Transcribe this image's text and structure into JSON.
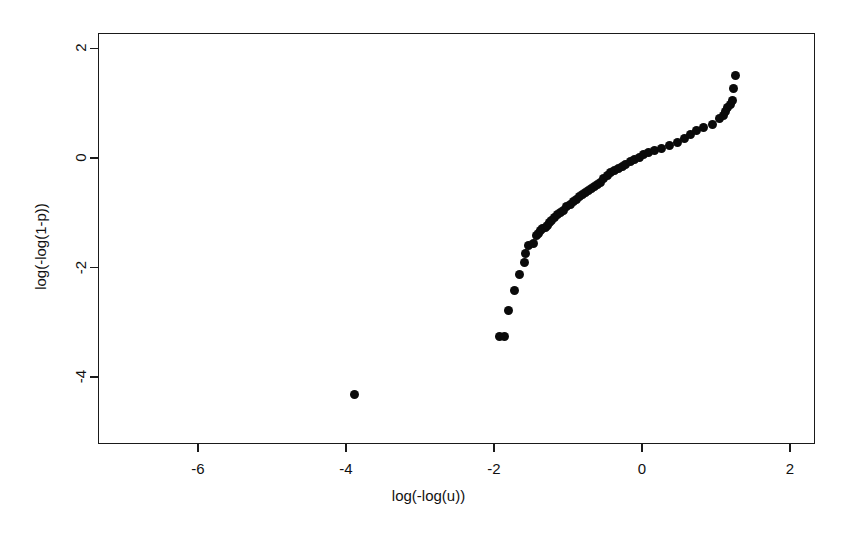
{
  "chart_data": {
    "type": "scatter",
    "title": "",
    "subtitle": "",
    "xlabel": "log(-log(u))",
    "ylabel": "log(-log(1-p))",
    "xlim": [
      -7.35,
      2.34
    ],
    "ylim": [
      -5.22,
      2.28
    ],
    "xticks": [
      -6,
      -4,
      -2,
      0,
      2
    ],
    "xticklabels": [
      "-6",
      "-4",
      "-2",
      "0",
      "2"
    ],
    "yticks": [
      2,
      0,
      -2,
      -4
    ],
    "yticklabels": [
      "2",
      "0",
      "-2",
      "-4"
    ],
    "grid": false,
    "legend": null,
    "legend_position": "none",
    "marker": "filled-circle",
    "marker_color": "#0a0a0a",
    "marker_size_px": 9,
    "series": [
      {
        "name": "quantile-pairs",
        "x": [
          -3.88,
          -1.93,
          -1.86,
          -1.8,
          -1.72,
          -1.66,
          -1.59,
          -1.57,
          -1.53,
          -1.47,
          -1.43,
          -1.4,
          -1.37,
          -1.34,
          -1.31,
          -1.28,
          -1.25,
          -1.22,
          -1.18,
          -1.14,
          -1.1,
          -1.06,
          -1.02,
          -0.97,
          -0.93,
          -0.88,
          -0.84,
          -0.8,
          -0.76,
          -0.72,
          -0.68,
          -0.64,
          -0.6,
          -0.56,
          -0.52,
          -0.47,
          -0.42,
          -0.37,
          -0.32,
          -0.27,
          -0.22,
          -0.16,
          -0.1,
          -0.04,
          0.02,
          0.09,
          0.17,
          0.26,
          0.37,
          0.48,
          0.58,
          0.66,
          0.74,
          0.83,
          0.95,
          1.05,
          1.1,
          1.13,
          1.16,
          1.19,
          1.22,
          1.24,
          1.26
        ],
        "y": [
          -4.32,
          -3.25,
          -3.26,
          -2.78,
          -2.42,
          -2.13,
          -1.9,
          -1.74,
          -1.59,
          -1.56,
          -1.42,
          -1.37,
          -1.33,
          -1.29,
          -1.26,
          -1.23,
          -1.18,
          -1.14,
          -1.09,
          -1.03,
          -0.99,
          -0.95,
          -0.89,
          -0.84,
          -0.79,
          -0.75,
          -0.71,
          -0.67,
          -0.63,
          -0.59,
          -0.56,
          -0.52,
          -0.48,
          -0.44,
          -0.38,
          -0.32,
          -0.26,
          -0.23,
          -0.19,
          -0.16,
          -0.11,
          -0.07,
          -0.03,
          0.01,
          0.06,
          0.1,
          0.14,
          0.18,
          0.23,
          0.28,
          0.36,
          0.43,
          0.5,
          0.56,
          0.62,
          0.72,
          0.78,
          0.85,
          0.92,
          0.98,
          1.05,
          1.26,
          1.5
        ]
      }
    ]
  }
}
